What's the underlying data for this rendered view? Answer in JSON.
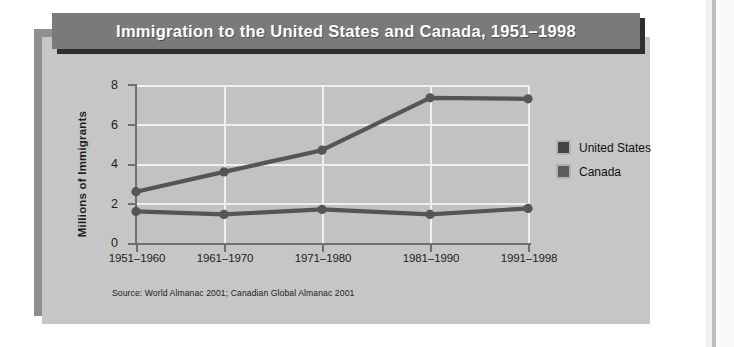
{
  "title": "Immigration to the United States and Canada, 1951–1998",
  "source_note": "Source: World Almanac 2001; Canadian Global Almanac 2001",
  "colors": {
    "title_bar": "#7a7a7a",
    "title_shadow": "#2e2e2e",
    "panel": "#c6c6c6",
    "panel_shadow": "#8f8f8f",
    "plot_area": "#c2c2c2",
    "gridline": "#efefef",
    "axis": "#6e6e6e",
    "series_united_states": "#555555",
    "series_canada": "#555555",
    "text": "#1d1d1d"
  },
  "legend": {
    "position": "right",
    "items": [
      {
        "label": "United States",
        "color": "#444444"
      },
      {
        "label": "Canada",
        "color": "#5c5c5c"
      }
    ]
  },
  "chart_data": {
    "type": "line",
    "title": "Immigration to the United States and Canada, 1951–1998",
    "xlabel": "",
    "ylabel": "Millions of Immigrants",
    "categories": [
      "1951–1960",
      "1961–1970",
      "1971–1980",
      "1981–1990",
      "1991–1998"
    ],
    "series": [
      {
        "name": "United States",
        "values": [
          2.6,
          3.6,
          4.7,
          7.35,
          7.3
        ]
      },
      {
        "name": "Canada",
        "values": [
          1.6,
          1.45,
          1.7,
          1.45,
          1.75
        ]
      }
    ],
    "ylim": [
      0,
      8
    ],
    "yticks": [
      "0",
      "2",
      "4",
      "6",
      "8"
    ],
    "ytick_values": [
      0,
      2,
      4,
      6,
      8
    ],
    "grid": "horizontal-and-vertical",
    "markers": "circle"
  }
}
